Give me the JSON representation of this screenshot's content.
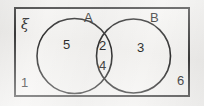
{
  "figure": {
    "type": "venn-diagram",
    "universe": {
      "symbol": "ξ",
      "name": "universal-set"
    },
    "sets": [
      {
        "id": "A",
        "label": "A"
      },
      {
        "id": "B",
        "label": "B"
      }
    ],
    "regions": [
      {
        "id": "a-only",
        "label": "5",
        "region": "A only"
      },
      {
        "id": "intersection-top",
        "label": "2",
        "region": "A and B"
      },
      {
        "id": "intersection-bottom",
        "label": "4",
        "region": "A and B"
      },
      {
        "id": "b-only",
        "label": "3",
        "region": "B only"
      },
      {
        "id": "outside-left",
        "label": "1",
        "region": "outside A and B"
      },
      {
        "id": "outside-right",
        "label": "6",
        "region": "outside A and B"
      }
    ],
    "colors": {
      "stroke": "#2f2f2f",
      "rect_border": "#3b3b3b",
      "text": "#2c2c2c",
      "background": "#f2f1ef",
      "rect_fill": "#f6f5f3"
    }
  }
}
